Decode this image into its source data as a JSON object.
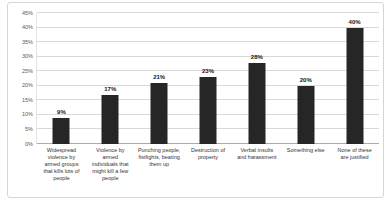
{
  "chart_data": {
    "type": "bar",
    "title": "",
    "xlabel": "",
    "ylabel": "",
    "categories": [
      "Widespread\nviolence by\narmed groups\nthat kills lots of\npeople",
      "Violence by\narmed\nindividuals that\nmight kill a few\npeople",
      "Punching people,\nfistfights, beating\nthem up",
      "Destruction of\nproperty",
      "Verbal insults\nand harassment",
      "Something else",
      "None of these\nare justified"
    ],
    "values": [
      9,
      17,
      21,
      23,
      28,
      20,
      40
    ],
    "data_labels": [
      "9%",
      "17%",
      "21%",
      "23%",
      "28%",
      "20%",
      "40%"
    ],
    "ylim": [
      0,
      45
    ],
    "y_ticks": [
      {
        "label": "0%",
        "value": 0
      },
      {
        "label": "5%",
        "value": 5
      },
      {
        "label": "10%",
        "value": 10
      },
      {
        "label": "15%",
        "value": 15
      },
      {
        "label": "20%",
        "value": 20
      },
      {
        "label": "25%",
        "value": 25
      },
      {
        "label": "30%",
        "value": 30
      },
      {
        "label": "35%",
        "value": 35
      },
      {
        "label": "40%",
        "value": 40
      },
      {
        "label": "45%",
        "value": 45
      }
    ],
    "grid": "horizontal",
    "legend": "none",
    "bar_color": "#262626",
    "gridline_color": "#d9d9d9",
    "zero_line_color": "#ababab",
    "axis_label_color": "#595959",
    "frame_border_color": "#d6d6d6"
  }
}
